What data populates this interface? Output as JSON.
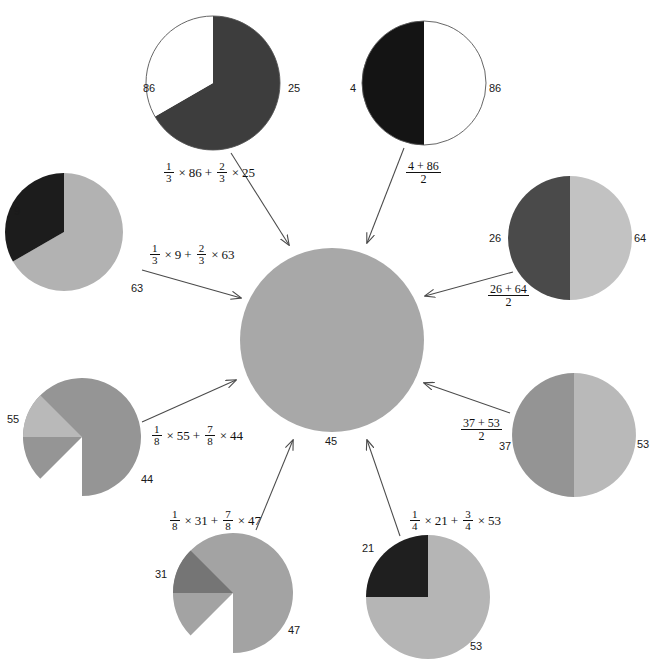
{
  "figure": {
    "type": "diagram",
    "background": "#ffffff"
  },
  "colors": {
    "black": "#1a1a1a",
    "dark_gray": "#4f4f4f",
    "mid_gray": "#8f8f8f",
    "light_gray": "#b9b9b9",
    "center_gray": "#a8a8a8",
    "white": "#ffffff",
    "stroke": "#555555",
    "text": "#111111"
  },
  "center": {
    "name": "center-circle",
    "value_label": "45",
    "fill": "#a8a8a8",
    "cx": 332,
    "cy": 340,
    "r": 92
  },
  "nodes": [
    {
      "id": "top-left",
      "name": "pie-86-25",
      "cx": 213,
      "cy": 83,
      "r": 67,
      "outline": true,
      "slices": [
        {
          "label": "25",
          "value": 25,
          "fraction": "2/3",
          "fill": "#3d3d3d",
          "start_deg": 0,
          "sweep_deg": 240
        },
        {
          "label": "86",
          "value": 86,
          "fraction": "1/3",
          "fill": "#ffffff",
          "start_deg": 240,
          "sweep_deg": 120
        }
      ],
      "labels": [
        {
          "text": "86",
          "x": 143,
          "y": 83
        },
        {
          "text": "25",
          "x": 288,
          "y": 83
        }
      ],
      "formula": {
        "kind": "weighted",
        "text": "1/3 x 86 + 2/3 x 25",
        "terms": [
          {
            "numer": "1",
            "denom": "3",
            "value": "86"
          },
          {
            "numer": "2",
            "denom": "3",
            "value": "25"
          }
        ],
        "x": 162,
        "y": 161
      }
    },
    {
      "id": "top-right",
      "name": "pie-4-86",
      "cx": 424,
      "cy": 83,
      "r": 62,
      "outline": true,
      "slices": [
        {
          "label": "86",
          "value": 86,
          "fraction": "1/2",
          "fill": "#ffffff",
          "start_deg": 0,
          "sweep_deg": 180
        },
        {
          "label": "4",
          "value": 4,
          "fraction": "1/2",
          "fill": "#141414",
          "start_deg": 180,
          "sweep_deg": 180
        }
      ],
      "labels": [
        {
          "text": "4",
          "x": 350,
          "y": 83
        },
        {
          "text": "86",
          "x": 489,
          "y": 83
        }
      ],
      "formula": {
        "kind": "mean",
        "text": "(4 + 86) / 2",
        "numer": "4 + 86",
        "denom": "2",
        "x": 404,
        "y": 160
      }
    },
    {
      "id": "left-upper",
      "name": "pie-9-63",
      "cx": 64,
      "cy": 232,
      "r": 59,
      "outline": false,
      "slices": [
        {
          "label": "63",
          "value": 63,
          "fraction": "2/3",
          "fill": "#b2b2b2",
          "start_deg": 0,
          "sweep_deg": 240
        },
        {
          "label": "9",
          "value": 9,
          "fraction": "1/3",
          "fill": "#1c1c1c",
          "start_deg": 240,
          "sweep_deg": 120
        }
      ],
      "labels": [
        {
          "text": "9",
          "x": 14,
          "y": 206
        },
        {
          "text": "63",
          "x": 131,
          "y": 283
        }
      ],
      "formula": {
        "kind": "weighted",
        "text": "1/3 x 9 + 2/3 x 63",
        "terms": [
          {
            "numer": "1",
            "denom": "3",
            "value": "9"
          },
          {
            "numer": "2",
            "denom": "3",
            "value": "63"
          }
        ],
        "x": 148,
        "y": 243
      }
    },
    {
      "id": "right-upper",
      "name": "pie-26-64",
      "cx": 570,
      "cy": 238,
      "r": 62,
      "outline": false,
      "slices": [
        {
          "label": "64",
          "value": 64,
          "fraction": "1/2",
          "fill": "#c2c2c2",
          "start_deg": 0,
          "sweep_deg": 180
        },
        {
          "label": "26",
          "value": 26,
          "fraction": "1/2",
          "fill": "#4a4a4a",
          "start_deg": 180,
          "sweep_deg": 180
        }
      ],
      "labels": [
        {
          "text": "26",
          "x": 489,
          "y": 233
        },
        {
          "text": "64",
          "x": 634,
          "y": 233
        }
      ],
      "formula": {
        "kind": "mean",
        "text": "(26 + 64) / 2",
        "numer": "26 + 64",
        "denom": "2",
        "x": 486,
        "y": 283
      }
    },
    {
      "id": "left-lower",
      "name": "pie-55-44",
      "cx": 82,
      "cy": 437,
      "r": 59,
      "outline": false,
      "slices": [
        {
          "label": "44",
          "value": 44,
          "fraction": "7/8",
          "fill": "#959595",
          "start_deg": 225,
          "sweep_deg": 315
        },
        {
          "label": "55",
          "value": 55,
          "fraction": "1/8",
          "fill": "#b9b9b9",
          "start_deg": 270,
          "sweep_deg": 45
        }
      ],
      "labels": [
        {
          "text": "55",
          "x": 7,
          "y": 414
        },
        {
          "text": "44",
          "x": 141,
          "y": 474
        }
      ],
      "formula": {
        "kind": "weighted",
        "text": "1/8 x 55 + 7/8 x 44",
        "terms": [
          {
            "numer": "1",
            "denom": "8",
            "value": "55"
          },
          {
            "numer": "7",
            "denom": "8",
            "value": "44"
          }
        ],
        "x": 150,
        "y": 424
      }
    },
    {
      "id": "right-lower",
      "name": "pie-37-53",
      "cx": 574,
      "cy": 435,
      "r": 62,
      "outline": false,
      "slices": [
        {
          "label": "53",
          "value": 53,
          "fraction": "1/2",
          "fill": "#b9b9b9",
          "start_deg": 0,
          "sweep_deg": 180
        },
        {
          "label": "37",
          "value": 37,
          "fraction": "1/2",
          "fill": "#949494",
          "start_deg": 180,
          "sweep_deg": 180
        }
      ],
      "labels": [
        {
          "text": "37",
          "x": 499,
          "y": 441
        },
        {
          "text": "53",
          "x": 637,
          "y": 439
        }
      ],
      "formula": {
        "kind": "mean",
        "text": "(37 + 53) / 2",
        "numer": "37 + 53",
        "denom": "2",
        "x": 459,
        "y": 417
      }
    },
    {
      "id": "bottom-left",
      "name": "pie-31-47",
      "cx": 233,
      "cy": 593,
      "r": 60,
      "outline": false,
      "slices": [
        {
          "label": "47",
          "value": 47,
          "fraction": "7/8",
          "fill": "#a3a3a3",
          "start_deg": 225,
          "sweep_deg": 315
        },
        {
          "label": "31",
          "value": 31,
          "fraction": "1/8",
          "fill": "#757575",
          "start_deg": 270,
          "sweep_deg": 45
        }
      ],
      "labels": [
        {
          "text": "31",
          "x": 155,
          "y": 569
        },
        {
          "text": "47",
          "x": 288,
          "y": 625
        }
      ],
      "formula": {
        "kind": "weighted",
        "text": "1/8 x 31 + 7/8 x 47",
        "terms": [
          {
            "numer": "1",
            "denom": "8",
            "value": "31"
          },
          {
            "numer": "7",
            "denom": "8",
            "value": "47"
          }
        ],
        "x": 168,
        "y": 509
      }
    },
    {
      "id": "bottom-right",
      "name": "pie-21-53",
      "cx": 428,
      "cy": 597,
      "r": 62,
      "outline": false,
      "slices": [
        {
          "label": "53",
          "value": 53,
          "fraction": "3/4",
          "fill": "#b5b5b5",
          "start_deg": 0,
          "sweep_deg": 270
        },
        {
          "label": "21",
          "value": 21,
          "fraction": "1/4",
          "fill": "#1f1f1f",
          "start_deg": 270,
          "sweep_deg": 90
        }
      ],
      "labels": [
        {
          "text": "21",
          "x": 362,
          "y": 543
        },
        {
          "text": "53",
          "x": 470,
          "y": 641
        }
      ],
      "formula": {
        "kind": "weighted",
        "text": "1/4 x 21 + 3/4 x 53",
        "terms": [
          {
            "numer": "1",
            "denom": "4",
            "value": "21"
          },
          {
            "numer": "3",
            "denom": "4",
            "value": "53"
          }
        ],
        "x": 408,
        "y": 509
      }
    }
  ],
  "arrows": [
    {
      "name": "arrow-from-top-left",
      "x1": 231,
      "y1": 153,
      "x2": 289,
      "y2": 245
    },
    {
      "name": "arrow-from-top-right",
      "x1": 404,
      "y1": 148,
      "x2": 367,
      "y2": 243
    },
    {
      "name": "arrow-from-left-upper",
      "x1": 142,
      "y1": 270,
      "x2": 241,
      "y2": 298
    },
    {
      "name": "arrow-from-right-upper",
      "x1": 513,
      "y1": 272,
      "x2": 425,
      "y2": 296
    },
    {
      "name": "arrow-from-left-lower",
      "x1": 142,
      "y1": 422,
      "x2": 236,
      "y2": 380
    },
    {
      "name": "arrow-from-right-lower",
      "x1": 510,
      "y1": 413,
      "x2": 424,
      "y2": 383
    },
    {
      "name": "arrow-from-bottom-left",
      "x1": 256,
      "y1": 530,
      "x2": 293,
      "y2": 440
    },
    {
      "name": "arrow-from-bottom-right",
      "x1": 400,
      "y1": 536,
      "x2": 367,
      "y2": 440
    }
  ]
}
